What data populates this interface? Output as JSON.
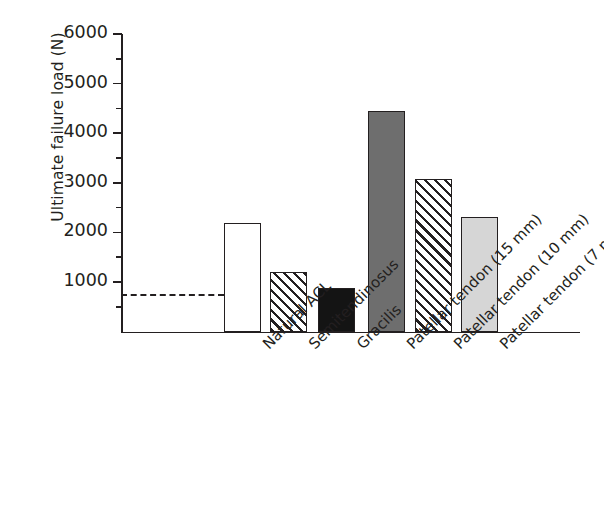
{
  "chart_data": {
    "type": "bar",
    "title": "",
    "xlabel": "",
    "ylabel": "Ultimate failure load (N)",
    "ylim": [
      0,
      6000
    ],
    "grid": false,
    "legend": "none",
    "y_ticks": [
      {
        "value": 6000,
        "label": "6000",
        "kind": "major"
      },
      {
        "value": 5500,
        "label": "",
        "kind": "minor"
      },
      {
        "value": 5000,
        "label": "5000",
        "kind": "major"
      },
      {
        "value": 4500,
        "label": "",
        "kind": "minor"
      },
      {
        "value": 4000,
        "label": "4000",
        "kind": "major"
      },
      {
        "value": 3500,
        "label": "",
        "kind": "minor"
      },
      {
        "value": 3000,
        "label": "3000",
        "kind": "major"
      },
      {
        "value": 2500,
        "label": "",
        "kind": "minor"
      },
      {
        "value": 2000,
        "label": "2000",
        "kind": "major"
      },
      {
        "value": 1500,
        "label": "",
        "kind": "minor"
      },
      {
        "value": 1000,
        "label": "1000",
        "kind": "major"
      },
      {
        "value": 500,
        "label": "",
        "kind": "minor"
      }
    ],
    "categories": [
      "Natural ACL",
      "Semitendinosus",
      "Gracilis",
      "Patellar tendon (15 mm)",
      "Patellar tendon (10 mm)",
      "Patellar tendon (7 mm)"
    ],
    "values": [
      2200,
      1220,
      880,
      4450,
      3080,
      2320
    ],
    "bar_styles": [
      "white",
      "hatch",
      "black",
      "dark-gray",
      "hatch",
      "light-gray"
    ],
    "colors": {
      "white": "#ffffff",
      "black": "#141414",
      "dark-gray": "#6e6e6e",
      "light-gray": "#d6d6d6",
      "hatch": "#ffffff",
      "outline": "#231f20"
    },
    "annotations": [
      {
        "name": "reference-line",
        "type": "horizontal-dashed-line",
        "value": 750,
        "label": "",
        "x_start_category_index": -1,
        "x_end_category_index": 0
      }
    ]
  }
}
